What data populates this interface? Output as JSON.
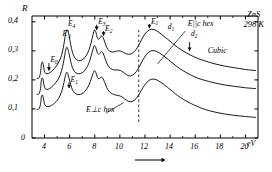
{
  "chart_data": {
    "type": "line",
    "title": "",
    "material": "ZnS",
    "temperature": "298 K",
    "xlabel": "eV",
    "ylabel": "R",
    "xlim": [
      3,
      21
    ],
    "ylim": [
      0,
      0.42
    ],
    "xticks": [
      4,
      6,
      8,
      10,
      12,
      14,
      16,
      18,
      20
    ],
    "xtick_labels": [
      "4",
      "6",
      "8",
      "10",
      "12",
      "14",
      "16",
      "18",
      "20"
    ],
    "yticks": [
      0,
      0.1,
      0.2,
      0.3,
      0.4
    ],
    "ytick_labels": [
      "0",
      "0,1",
      "0,2",
      "0,3",
      "0,4"
    ],
    "grid": false,
    "axis_arrow": true,
    "dashed_marker_x": 11.5,
    "series": [
      {
        "name": "Cubic",
        "label": "Cubic",
        "points": [
          [
            3.4,
            0.205
          ],
          [
            3.55,
            0.207
          ],
          [
            3.68,
            0.225
          ],
          [
            3.74,
            0.252
          ],
          [
            3.82,
            0.262
          ],
          [
            3.9,
            0.252
          ],
          [
            3.98,
            0.232
          ],
          [
            4.1,
            0.222
          ],
          [
            4.3,
            0.222
          ],
          [
            4.55,
            0.229
          ],
          [
            4.8,
            0.24
          ],
          [
            5.05,
            0.255
          ],
          [
            5.25,
            0.272
          ],
          [
            5.42,
            0.296
          ],
          [
            5.55,
            0.325
          ],
          [
            5.66,
            0.355
          ],
          [
            5.76,
            0.372
          ],
          [
            5.86,
            0.368
          ],
          [
            5.96,
            0.35
          ],
          [
            6.08,
            0.322
          ],
          [
            6.22,
            0.295
          ],
          [
            6.4,
            0.277
          ],
          [
            6.6,
            0.268
          ],
          [
            6.85,
            0.266
          ],
          [
            7.1,
            0.272
          ],
          [
            7.35,
            0.286
          ],
          [
            7.55,
            0.305
          ],
          [
            7.72,
            0.33
          ],
          [
            7.86,
            0.356
          ],
          [
            7.97,
            0.372
          ],
          [
            8.08,
            0.366
          ],
          [
            8.18,
            0.348
          ],
          [
            8.3,
            0.34
          ],
          [
            8.42,
            0.345
          ],
          [
            8.54,
            0.352
          ],
          [
            8.66,
            0.346
          ],
          [
            8.8,
            0.33
          ],
          [
            8.95,
            0.312
          ],
          [
            9.15,
            0.3
          ],
          [
            9.4,
            0.296
          ],
          [
            9.65,
            0.298
          ],
          [
            9.9,
            0.3
          ],
          [
            10.15,
            0.298
          ],
          [
            10.4,
            0.292
          ],
          [
            10.7,
            0.288
          ],
          [
            11.0,
            0.292
          ],
          [
            11.3,
            0.305
          ],
          [
            11.6,
            0.328
          ],
          [
            11.9,
            0.352
          ],
          [
            12.2,
            0.368
          ],
          [
            12.5,
            0.374
          ],
          [
            12.8,
            0.372
          ],
          [
            13.1,
            0.364
          ],
          [
            13.45,
            0.352
          ],
          [
            13.8,
            0.34
          ],
          [
            14.2,
            0.326
          ],
          [
            14.6,
            0.312
          ],
          [
            15.1,
            0.298
          ],
          [
            15.6,
            0.286
          ],
          [
            16.2,
            0.274
          ],
          [
            16.8,
            0.265
          ],
          [
            17.5,
            0.256
          ],
          [
            18.3,
            0.248
          ],
          [
            19.1,
            0.242
          ],
          [
            20.0,
            0.236
          ],
          [
            20.8,
            0.232
          ]
        ]
      },
      {
        "name": "E-parallel-c-hex",
        "label": "E||c hex",
        "points": [
          [
            3.4,
            0.15
          ],
          [
            3.55,
            0.152
          ],
          [
            3.68,
            0.17
          ],
          [
            3.74,
            0.197
          ],
          [
            3.82,
            0.207
          ],
          [
            3.9,
            0.197
          ],
          [
            3.98,
            0.178
          ],
          [
            4.1,
            0.168
          ],
          [
            4.3,
            0.168
          ],
          [
            4.55,
            0.175
          ],
          [
            4.8,
            0.186
          ],
          [
            5.05,
            0.2
          ],
          [
            5.25,
            0.218
          ],
          [
            5.42,
            0.242
          ],
          [
            5.55,
            0.27
          ],
          [
            5.66,
            0.298
          ],
          [
            5.76,
            0.312
          ],
          [
            5.86,
            0.306
          ],
          [
            5.96,
            0.288
          ],
          [
            6.08,
            0.264
          ],
          [
            6.22,
            0.242
          ],
          [
            6.4,
            0.228
          ],
          [
            6.6,
            0.222
          ],
          [
            6.85,
            0.222
          ],
          [
            7.1,
            0.228
          ],
          [
            7.35,
            0.242
          ],
          [
            7.55,
            0.26
          ],
          [
            7.72,
            0.284
          ],
          [
            7.86,
            0.306
          ],
          [
            7.97,
            0.318
          ],
          [
            8.08,
            0.312
          ],
          [
            8.18,
            0.296
          ],
          [
            8.3,
            0.288
          ],
          [
            8.42,
            0.292
          ],
          [
            8.54,
            0.298
          ],
          [
            8.66,
            0.292
          ],
          [
            8.8,
            0.276
          ],
          [
            8.95,
            0.258
          ],
          [
            9.15,
            0.244
          ],
          [
            9.4,
            0.236
          ],
          [
            9.65,
            0.234
          ],
          [
            9.9,
            0.234
          ],
          [
            10.15,
            0.23
          ],
          [
            10.4,
            0.222
          ],
          [
            10.7,
            0.214
          ],
          [
            11.0,
            0.216
          ],
          [
            11.3,
            0.228
          ],
          [
            11.6,
            0.25
          ],
          [
            11.9,
            0.274
          ],
          [
            12.2,
            0.292
          ],
          [
            12.5,
            0.3
          ],
          [
            12.8,
            0.3
          ],
          [
            13.1,
            0.294
          ],
          [
            13.45,
            0.284
          ],
          [
            13.8,
            0.272
          ],
          [
            14.2,
            0.258
          ],
          [
            14.6,
            0.244
          ],
          [
            15.1,
            0.23
          ],
          [
            15.6,
            0.218
          ],
          [
            16.2,
            0.206
          ],
          [
            16.8,
            0.198
          ],
          [
            17.5,
            0.19
          ],
          [
            18.3,
            0.183
          ],
          [
            19.1,
            0.178
          ],
          [
            20.0,
            0.173
          ],
          [
            20.8,
            0.17
          ]
        ]
      },
      {
        "name": "E-perp-c-hex",
        "label": "E⊥c hex",
        "points": [
          [
            3.4,
            0.098
          ],
          [
            3.55,
            0.1
          ],
          [
            3.68,
            0.116
          ],
          [
            3.74,
            0.14
          ],
          [
            3.82,
            0.148
          ],
          [
            3.9,
            0.138
          ],
          [
            3.98,
            0.12
          ],
          [
            4.1,
            0.11
          ],
          [
            4.3,
            0.108
          ],
          [
            4.55,
            0.112
          ],
          [
            4.8,
            0.12
          ],
          [
            5.05,
            0.132
          ],
          [
            5.25,
            0.148
          ],
          [
            5.42,
            0.168
          ],
          [
            5.55,
            0.192
          ],
          [
            5.66,
            0.214
          ],
          [
            5.76,
            0.226
          ],
          [
            5.86,
            0.22
          ],
          [
            5.96,
            0.204
          ],
          [
            6.08,
            0.184
          ],
          [
            6.22,
            0.166
          ],
          [
            6.4,
            0.155
          ],
          [
            6.6,
            0.15
          ],
          [
            6.85,
            0.15
          ],
          [
            7.1,
            0.156
          ],
          [
            7.35,
            0.168
          ],
          [
            7.55,
            0.184
          ],
          [
            7.72,
            0.204
          ],
          [
            7.86,
            0.222
          ],
          [
            7.97,
            0.232
          ],
          [
            8.08,
            0.226
          ],
          [
            8.18,
            0.212
          ],
          [
            8.3,
            0.204
          ],
          [
            8.42,
            0.206
          ],
          [
            8.54,
            0.21
          ],
          [
            8.66,
            0.204
          ],
          [
            8.8,
            0.19
          ],
          [
            8.95,
            0.174
          ],
          [
            9.15,
            0.16
          ],
          [
            9.4,
            0.152
          ],
          [
            9.65,
            0.148
          ],
          [
            9.9,
            0.146
          ],
          [
            10.15,
            0.142
          ],
          [
            10.4,
            0.134
          ],
          [
            10.7,
            0.126
          ],
          [
            11.0,
            0.126
          ],
          [
            11.3,
            0.136
          ],
          [
            11.6,
            0.156
          ],
          [
            11.9,
            0.178
          ],
          [
            12.2,
            0.194
          ],
          [
            12.5,
            0.202
          ],
          [
            12.8,
            0.202
          ],
          [
            13.1,
            0.196
          ],
          [
            13.45,
            0.186
          ],
          [
            13.8,
            0.174
          ],
          [
            14.2,
            0.16
          ],
          [
            14.6,
            0.146
          ],
          [
            15.1,
            0.132
          ],
          [
            15.6,
            0.12
          ],
          [
            16.2,
            0.108
          ],
          [
            16.8,
            0.098
          ],
          [
            17.5,
            0.09
          ],
          [
            18.3,
            0.083
          ],
          [
            19.1,
            0.078
          ],
          [
            20.0,
            0.074
          ],
          [
            20.8,
            0.071
          ]
        ]
      }
    ],
    "peak_labels": [
      {
        "id": "E0",
        "base": "E",
        "sub": "0",
        "x": 4.35,
        "y": 0.268,
        "arrow_from": 0.258,
        "arrow_to": 0.232
      },
      {
        "id": "E1",
        "base": "E",
        "sub": "1",
        "x": 5.95,
        "y": 0.198,
        "arrow_from": 0.192,
        "arrow_to": 0.172
      },
      {
        "id": "E1p",
        "base": "E",
        "sub": "1",
        "prime": "'",
        "x": 5.3,
        "y": 0.358,
        "arrow": false
      },
      {
        "id": "E4",
        "base": "E",
        "sub": "4",
        "x": 5.75,
        "y": 0.392,
        "arrow": false
      },
      {
        "id": "E3",
        "base": "E",
        "sub": "3",
        "x": 8.15,
        "y": 0.398,
        "arrow_from": 0.39,
        "arrow_to": 0.372
      },
      {
        "id": "E2",
        "base": "E",
        "sub": "2",
        "x": 8.7,
        "y": 0.375,
        "arrow_from": 0.368,
        "arrow_to": 0.352
      },
      {
        "id": "E1b",
        "base": "E",
        "sub": "1",
        "x": 12.35,
        "y": 0.4,
        "arrow_from": 0.392,
        "arrow_to": 0.378
      },
      {
        "id": "d1",
        "base": "d",
        "sub": "1",
        "x": 13.7,
        "y": 0.382,
        "arrow": false
      },
      {
        "id": "d2",
        "base": "d",
        "sub": "2",
        "x": 15.55,
        "y": 0.358,
        "arrow_from": 0.33,
        "arrow_to": 0.3
      }
    ],
    "annotations": [
      {
        "id": "cubic",
        "text": "Cubic",
        "x": 17.0,
        "y": 0.3
      },
      {
        "id": "e-par",
        "text": "E||c hex",
        "x": 15.4,
        "y": 0.392
      },
      {
        "id": "e-perp",
        "text": "E⊥c hex",
        "x": 7.3,
        "y": 0.095
      }
    ]
  }
}
